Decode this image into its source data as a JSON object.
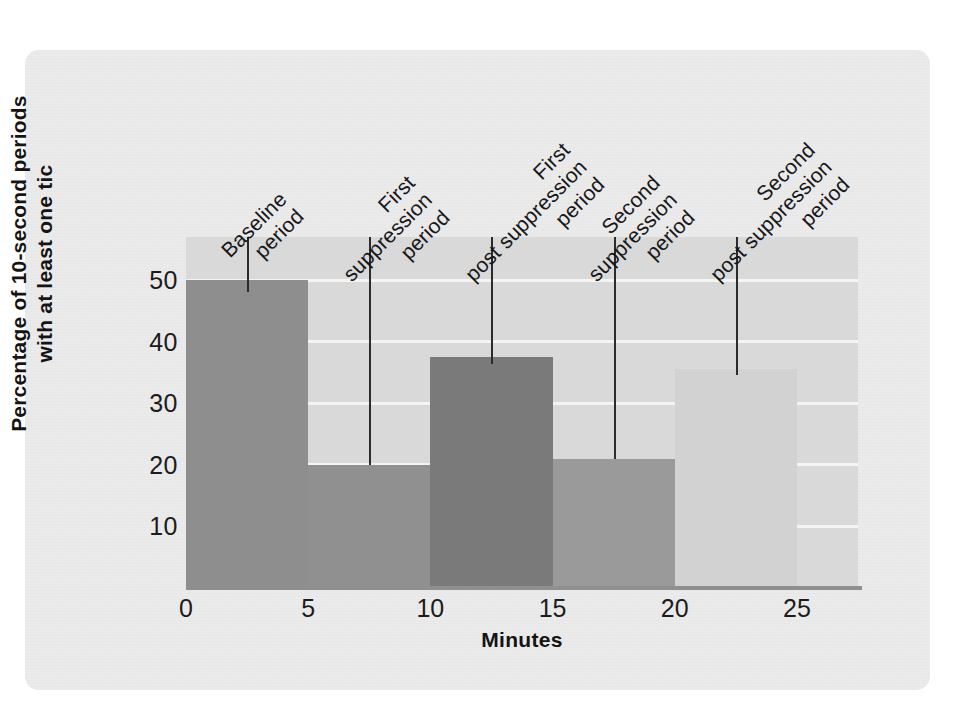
{
  "chart_data": {
    "type": "bar",
    "title": "",
    "subtitle": "",
    "xlabel": "Minutes",
    "ylabel": "Percentage of 10-second periods with at least one tic",
    "ylabel_lines": [
      "Percentage of 10-second periods",
      "with at least one tic"
    ],
    "xlim": [
      0,
      27.5
    ],
    "ylim": [
      0,
      57
    ],
    "grid": true,
    "legend": "none",
    "x_ticks": [
      "0",
      "5",
      "10",
      "15",
      "20",
      "25"
    ],
    "x_tick_values": [
      0,
      5,
      10,
      15,
      20,
      25
    ],
    "y_ticks": [
      "10",
      "20",
      "30",
      "40",
      "50"
    ],
    "y_tick_values": [
      10,
      20,
      30,
      40,
      50
    ],
    "categories": [
      "Baseline period",
      "First suppression period",
      "First post suppression period",
      "Second suppression period",
      "Second post suppression period"
    ],
    "values": [
      50,
      20,
      37.5,
      21,
      35.5
    ],
    "bar_x_start": [
      0,
      5,
      10,
      15,
      20
    ],
    "bar_x_end": [
      5,
      10,
      15,
      20,
      25
    ],
    "bar_colors": [
      "#8e8e8e",
      "#909090",
      "#7a7a7a",
      "#9a9a9a",
      "#d2d2d2"
    ],
    "annotations": [
      {
        "label_lines": [
          "Baseline",
          "period"
        ],
        "x": 2.5,
        "leader_top": 237,
        "leader_bottom": 292
      },
      {
        "label_lines": [
          "First",
          "suppression",
          "period"
        ],
        "x": 7.5,
        "leader_top": 237,
        "leader_bottom": 465
      },
      {
        "label_lines": [
          "First",
          "post suppression",
          "period"
        ],
        "x": 12.5,
        "leader_top": 237,
        "leader_bottom": 364
      },
      {
        "label_lines": [
          "Second",
          "suppression",
          "period"
        ],
        "x": 17.5,
        "leader_top": 237,
        "leader_bottom": 459
      },
      {
        "label_lines": [
          "Second",
          "post suppression",
          "period"
        ],
        "x": 22.5,
        "leader_top": 237,
        "leader_bottom": 375
      }
    ],
    "colors": {
      "panel_background": "#ebebeb",
      "plot_background": "#d9d9d9",
      "gridline": "#f4f4f4",
      "axis_line": "#8f8f8f",
      "text": "#1c1c1c",
      "leader_line": "#2b2b2b"
    }
  }
}
